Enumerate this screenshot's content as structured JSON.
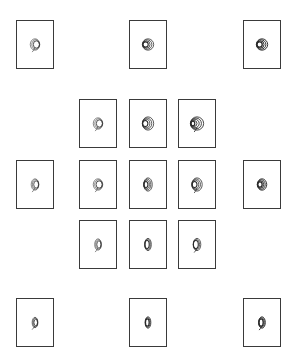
{
  "figure": {
    "panels": [
      {
        "id": "top-left",
        "x": 16,
        "y": 20,
        "w": 38,
        "h": 49,
        "rings": 3,
        "rx": 5,
        "ry": 6,
        "dx": 1.2,
        "stroke": 0.6,
        "tail": true
      },
      {
        "id": "top-center",
        "x": 129,
        "y": 20,
        "w": 38,
        "h": 49,
        "rings": 4,
        "rx": 6,
        "ry": 6,
        "dx": -1.4,
        "stroke": 0.8,
        "tail": false
      },
      {
        "id": "top-right",
        "x": 243,
        "y": 20,
        "w": 38,
        "h": 49,
        "rings": 4,
        "rx": 6,
        "ry": 6,
        "dx": -1.4,
        "stroke": 1.0,
        "tail": false
      },
      {
        "id": "grid-r1-c1",
        "x": 79,
        "y": 99,
        "w": 38,
        "h": 49,
        "rings": 3,
        "rx": 5,
        "ry": 6,
        "dx": 1.2,
        "stroke": 0.6,
        "tail": true
      },
      {
        "id": "grid-r1-c2",
        "x": 129,
        "y": 99,
        "w": 38,
        "h": 49,
        "rings": 4,
        "rx": 6,
        "ry": 7,
        "dx": -1.6,
        "stroke": 0.8,
        "tail": false
      },
      {
        "id": "grid-r1-c3",
        "x": 178,
        "y": 99,
        "w": 38,
        "h": 49,
        "rings": 5,
        "rx": 7,
        "ry": 7,
        "dx": -1.8,
        "stroke": 0.9,
        "tail": true
      },
      {
        "id": "mid-left",
        "x": 16,
        "y": 160,
        "w": 38,
        "h": 49,
        "rings": 3,
        "rx": 4,
        "ry": 6,
        "dx": 1,
        "stroke": 0.6,
        "tail": true
      },
      {
        "id": "grid-r2-c1",
        "x": 79,
        "y": 160,
        "w": 38,
        "h": 49,
        "rings": 3,
        "rx": 5,
        "ry": 6,
        "dx": 1,
        "stroke": 0.6,
        "tail": true
      },
      {
        "id": "grid-r2-c2",
        "x": 129,
        "y": 160,
        "w": 38,
        "h": 49,
        "rings": 4,
        "rx": 4.5,
        "ry": 7,
        "dx": -1.2,
        "stroke": 0.8,
        "tail": false
      },
      {
        "id": "grid-r2-c3",
        "x": 178,
        "y": 160,
        "w": 38,
        "h": 49,
        "rings": 4,
        "rx": 5.5,
        "ry": 7,
        "dx": -1.4,
        "stroke": 0.8,
        "tail": true
      },
      {
        "id": "mid-right",
        "x": 243,
        "y": 160,
        "w": 38,
        "h": 49,
        "rings": 4,
        "rx": 5,
        "ry": 6,
        "dx": -1.2,
        "stroke": 1.0,
        "tail": false
      },
      {
        "id": "grid-r3-c1",
        "x": 79,
        "y": 220,
        "w": 38,
        "h": 49,
        "rings": 3,
        "rx": 3.5,
        "ry": 6,
        "dx": 0.8,
        "stroke": 0.6,
        "tail": true
      },
      {
        "id": "grid-r3-c2",
        "x": 129,
        "y": 220,
        "w": 38,
        "h": 49,
        "rings": 3,
        "rx": 3.5,
        "ry": 6.5,
        "dx": -0.8,
        "stroke": 0.8,
        "tail": false
      },
      {
        "id": "grid-r3-c3",
        "x": 178,
        "y": 220,
        "w": 38,
        "h": 49,
        "rings": 3,
        "rx": 4,
        "ry": 6.5,
        "dx": -1,
        "stroke": 0.8,
        "tail": true
      },
      {
        "id": "bottom-left",
        "x": 16,
        "y": 298,
        "w": 38,
        "h": 49,
        "rings": 3,
        "rx": 3,
        "ry": 5.5,
        "dx": 0.6,
        "stroke": 0.7,
        "tail": true
      },
      {
        "id": "bottom-center",
        "x": 129,
        "y": 298,
        "w": 38,
        "h": 49,
        "rings": 3,
        "rx": 3,
        "ry": 6,
        "dx": -0.6,
        "stroke": 0.9,
        "tail": false
      },
      {
        "id": "bottom-right",
        "x": 243,
        "y": 298,
        "w": 38,
        "h": 49,
        "rings": 3,
        "rx": 3.5,
        "ry": 6,
        "dx": -0.8,
        "stroke": 1.0,
        "tail": true
      }
    ],
    "colors": {
      "stroke": "#2a2a2a",
      "border": "#3a3a3a",
      "background": "#ffffff"
    }
  }
}
